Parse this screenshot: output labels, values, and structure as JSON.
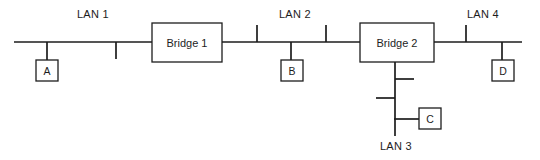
{
  "diagram": {
    "type": "network-topology",
    "colors": {
      "line": "#1d1d1d",
      "background": "#ffffff",
      "box_fill": "#ffffff"
    },
    "segments": [
      {
        "id": "lan1",
        "label": "LAN 1",
        "label_x": 93,
        "label_y": 14,
        "bus_y": 42,
        "bus_x1": 14,
        "bus_x2": 152,
        "taps": [
          {
            "x": 116,
            "dir": "down",
            "length": 17
          }
        ]
      },
      {
        "id": "lan2",
        "label": "LAN 2",
        "label_x": 295,
        "label_y": 14,
        "bus_y": 42,
        "bus_x1": 222,
        "bus_x2": 360,
        "taps": [
          {
            "x": 257,
            "dir": "up",
            "length": 17
          },
          {
            "x": 326,
            "dir": "up",
            "length": 17
          }
        ]
      },
      {
        "id": "lan3",
        "label": "LAN 3",
        "label_x": 396,
        "label_y": 146,
        "orientation": "vertical",
        "bus_x": 395,
        "bus_y1": 62,
        "bus_y2": 136,
        "taps": [
          {
            "y": 79,
            "dir": "right",
            "length": 19
          },
          {
            "y": 98,
            "dir": "left",
            "length": 19
          }
        ]
      },
      {
        "id": "lan4",
        "label": "LAN 4",
        "label_x": 483,
        "label_y": 14,
        "bus_y": 42,
        "bus_x1": 434,
        "bus_x2": 522,
        "taps": [
          {
            "x": 466,
            "dir": "up",
            "length": 17
          }
        ]
      }
    ],
    "bridges": [
      {
        "id": "bridge1",
        "label": "Bridge 1",
        "x": 152,
        "y": 23,
        "width": 70,
        "height": 39
      },
      {
        "id": "bridge2",
        "label": "Bridge 2",
        "x": 360,
        "y": 23,
        "width": 74,
        "height": 39
      }
    ],
    "stations": [
      {
        "id": "station-a",
        "label": "A",
        "x": 36,
        "y": 60,
        "width": 22,
        "height": 21,
        "connector": {
          "x1": 47,
          "y1": 42,
          "x2": 47,
          "y2": 60,
          "orientation": "vertical"
        }
      },
      {
        "id": "station-b",
        "label": "B",
        "x": 281,
        "y": 60,
        "width": 22,
        "height": 21,
        "connector": {
          "x1": 291,
          "y1": 42,
          "x2": 291,
          "y2": 60,
          "orientation": "vertical"
        }
      },
      {
        "id": "station-c",
        "label": "C",
        "x": 419,
        "y": 108,
        "width": 22,
        "height": 21,
        "connector": {
          "x1": 395,
          "y1": 119,
          "x2": 419,
          "y2": 119,
          "orientation": "horizontal"
        }
      },
      {
        "id": "station-d",
        "label": "D",
        "x": 492,
        "y": 60,
        "width": 22,
        "height": 21,
        "connector": {
          "x1": 502,
          "y1": 42,
          "x2": 502,
          "y2": 60,
          "orientation": "vertical"
        }
      }
    ]
  }
}
